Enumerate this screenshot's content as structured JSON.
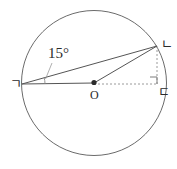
{
  "figure": {
    "kind": "circle-geometry-diagram",
    "background_color": "#ffffff",
    "stroke_color": "#555555",
    "dashed_color": "#8a8a8a",
    "text_color": "#2b2b2b",
    "labels": {
      "angle": "15°",
      "vertex_left": "ㄱ",
      "vertex_upper_right": "ㄴ",
      "vertex_lower_right": "ㄷ",
      "center": "O"
    },
    "geometry": {
      "circle": {
        "cx": 94,
        "cy": 83,
        "r": 73
      },
      "points": {
        "center_o": {
          "x": 94,
          "y": 83
        },
        "vertex_g": {
          "x": 22,
          "y": 84
        },
        "vertex_n": {
          "x": 157,
          "y": 46
        },
        "vertex_d": {
          "x": 157,
          "y": 84
        }
      },
      "solid_segments": [
        {
          "name": "g-to-n",
          "x1": 22,
          "y1": 84,
          "x2": 157,
          "y2": 46
        },
        {
          "name": "g-to-o",
          "x1": 22,
          "y1": 84,
          "x2": 94,
          "y2": 83
        },
        {
          "name": "o-to-n",
          "x1": 94,
          "y1": 83,
          "x2": 157,
          "y2": 46
        }
      ],
      "dashed_segments": [
        {
          "name": "o-to-d",
          "x1": 94,
          "y1": 84,
          "x2": 157,
          "y2": 84
        },
        {
          "name": "n-to-d",
          "x1": 157,
          "y1": 46,
          "x2": 157,
          "y2": 84
        }
      ],
      "angle_arc": {
        "vertex": "ㄱ",
        "value_degrees": 15
      },
      "right_angle_marker": {
        "at": "ㄷ",
        "size": 7
      }
    }
  }
}
